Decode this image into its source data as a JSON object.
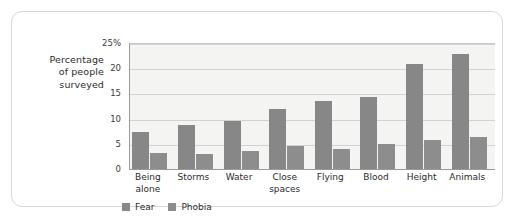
{
  "chart_data": {
    "type": "bar",
    "title": "",
    "xlabel": "",
    "ylabel": "Percentage of people surveyed",
    "ylabel_lines": [
      "Percentage",
      "of people",
      "surveyed"
    ],
    "categories": [
      "Being alone",
      "Storms",
      "Water",
      "Close spaces",
      "Flying",
      "Blood",
      "Height",
      "Animals"
    ],
    "category_lines": [
      [
        "Being",
        "alone"
      ],
      [
        "Storms"
      ],
      [
        "Water"
      ],
      [
        "Close",
        "spaces"
      ],
      [
        "Flying"
      ],
      [
        "Blood"
      ],
      [
        "Height"
      ],
      [
        "Animals"
      ]
    ],
    "series": [
      {
        "name": "Fear",
        "color": "#878787",
        "values": [
          7.3,
          8.8,
          9.6,
          12.0,
          13.5,
          14.3,
          20.9,
          22.8
        ]
      },
      {
        "name": "Phobia",
        "color": "#8d8d8d",
        "values": [
          3.1,
          3.0,
          3.5,
          4.5,
          3.9,
          5.0,
          5.8,
          6.4
        ]
      }
    ],
    "ylim": [
      0,
      25
    ],
    "yticks": [
      0,
      5,
      10,
      15,
      20,
      25
    ],
    "ytick_labels": [
      "0",
      "5",
      "10",
      "15",
      "20",
      "25%"
    ],
    "grid": true,
    "legend_position": "bottom-left",
    "plot_background": "#f4f4f2",
    "frame_color": "#d8d8d8"
  }
}
